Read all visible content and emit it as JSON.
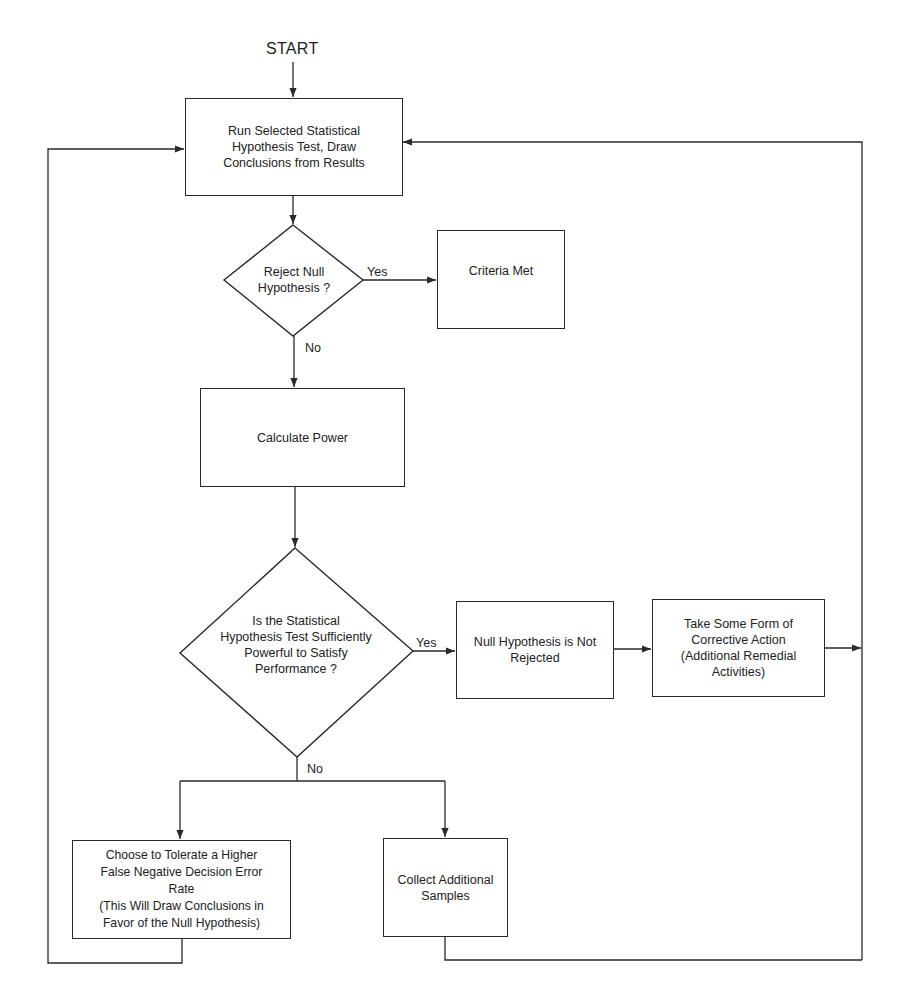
{
  "diagram": {
    "start_label": "START",
    "nodes": {
      "run_test": {
        "label": "Run Selected Statistical\nHypothesis Test, Draw\nConclusions from Results",
        "shape": "rectangle"
      },
      "reject_null": {
        "label": "Reject Null\nHypothesis ?",
        "shape": "diamond"
      },
      "criteria_met": {
        "label": "Criteria Met",
        "shape": "rectangle"
      },
      "calculate_power": {
        "label": "Calculate Power",
        "shape": "rectangle"
      },
      "sufficient_power": {
        "label": "Is the Statistical\nHypothesis Test Sufficiently\nPowerful to Satisfy\nPerformance ?",
        "shape": "diamond"
      },
      "null_not_rejected": {
        "label": "Null Hypothesis is Not\nRejected",
        "shape": "rectangle"
      },
      "corrective_action": {
        "label": "Take Some Form of\nCorrective Action\n(Additional Remedial\nActivities)",
        "shape": "rectangle"
      },
      "tolerate_error": {
        "label": "Choose to Tolerate a Higher\nFalse Negative Decision Error\nRate\n(This Will Draw Conclusions in\nFavor of the Null Hypothesis)",
        "shape": "rectangle"
      },
      "collect_samples": {
        "label": "Collect Additional\nSamples",
        "shape": "rectangle"
      }
    },
    "edge_labels": {
      "reject_yes": "Yes",
      "reject_no": "No",
      "power_yes": "Yes",
      "power_no": "No"
    },
    "edges": [
      {
        "from": "START",
        "to": "run_test"
      },
      {
        "from": "run_test",
        "to": "reject_null"
      },
      {
        "from": "reject_null",
        "to": "criteria_met",
        "label": "Yes"
      },
      {
        "from": "reject_null",
        "to": "calculate_power",
        "label": "No"
      },
      {
        "from": "calculate_power",
        "to": "sufficient_power"
      },
      {
        "from": "sufficient_power",
        "to": "null_not_rejected",
        "label": "Yes"
      },
      {
        "from": "null_not_rejected",
        "to": "corrective_action"
      },
      {
        "from": "corrective_action",
        "to": "run_test"
      },
      {
        "from": "sufficient_power",
        "to": "tolerate_error",
        "label": "No"
      },
      {
        "from": "sufficient_power",
        "to": "collect_samples",
        "label": "No"
      },
      {
        "from": "tolerate_error",
        "to": "run_test"
      },
      {
        "from": "collect_samples",
        "to": "run_test"
      }
    ],
    "colors": {
      "stroke": "#2a2a2a",
      "text": "#222222",
      "background": "#ffffff"
    }
  }
}
